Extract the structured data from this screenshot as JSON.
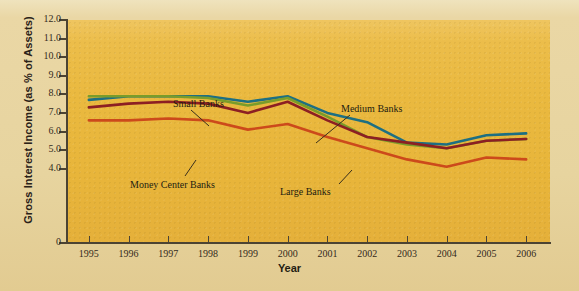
{
  "chart_data": {
    "type": "line",
    "title": "",
    "xlabel": "Year",
    "ylabel": "Gross Interest Income (as % of Assets)",
    "x": [
      1995,
      1996,
      1997,
      1998,
      1999,
      2000,
      2001,
      2002,
      2003,
      2004,
      2005,
      2006
    ],
    "xtick_labels": [
      "1995",
      "1996",
      "1997",
      "1998",
      "1999",
      "2000",
      "2001",
      "2002",
      "2003",
      "2004",
      "2005",
      "2006"
    ],
    "ytick_labels": [
      "12.0",
      "11.0",
      "10.0",
      "9.0",
      "8.0",
      "7.0",
      "6.0",
      "5.0",
      "4.0",
      "0"
    ],
    "ytick_values": [
      12.0,
      11.0,
      10.0,
      9.0,
      8.0,
      7.0,
      6.0,
      5.0,
      4.0,
      0
    ],
    "ylim": [
      0,
      12.0
    ],
    "grid": false,
    "legend_position": "inline-annotations",
    "series": [
      {
        "name": "Small Banks",
        "color": "#1d6f82",
        "values": [
          7.7,
          7.9,
          7.9,
          7.9,
          7.6,
          7.9,
          7.0,
          6.5,
          5.4,
          5.3,
          5.8,
          5.9
        ]
      },
      {
        "name": "Medium Banks",
        "color": "#7a9c2a",
        "values": [
          7.9,
          7.9,
          7.9,
          7.8,
          7.4,
          7.8,
          6.8,
          5.7,
          5.3,
          5.1,
          5.5,
          5.6
        ]
      },
      {
        "name": "Large Banks",
        "color": "#8c1f23",
        "values": [
          7.3,
          7.5,
          7.6,
          7.5,
          7.0,
          7.6,
          6.6,
          5.7,
          5.4,
          5.1,
          5.5,
          5.6
        ]
      },
      {
        "name": "Money Center Banks",
        "color": "#cc4a1b",
        "values": [
          6.6,
          6.6,
          6.7,
          6.6,
          6.1,
          6.4,
          5.7,
          5.1,
          4.5,
          4.1,
          4.6,
          4.5
        ]
      }
    ],
    "annotations": [
      {
        "label": "Small Banks",
        "x_px": 173,
        "y_px": 98,
        "leader_from": [
          191,
          110
        ],
        "leader_to": [
          209,
          126
        ]
      },
      {
        "label": "Medium Banks",
        "x_px": 341,
        "y_px": 103,
        "leader_from": [
          350,
          115
        ],
        "leader_to": [
          316,
          143
        ]
      },
      {
        "label": "Money Center Banks",
        "x_px": 130,
        "y_px": 179,
        "leader_from": [
          185,
          176
        ],
        "leader_to": [
          196,
          160
        ]
      },
      {
        "label": "Large Banks",
        "x_px": 280,
        "y_px": 186,
        "leader_from": [
          339,
          184
        ],
        "leader_to": [
          352,
          170
        ]
      }
    ]
  },
  "colors": {
    "page_background": "#e8d9a8",
    "plot_background": "#eab93f",
    "axis": "#4b4333",
    "text": "#231c10"
  }
}
